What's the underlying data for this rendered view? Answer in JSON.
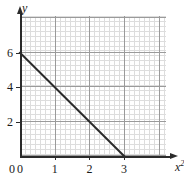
{
  "chart_data": {
    "type": "line",
    "title": "",
    "xlabel": "x²",
    "ylabel": "y",
    "xlabel_base": "x",
    "xlabel_exp": "2",
    "xlim": [
      0,
      4.2
    ],
    "ylim": [
      0,
      8.1
    ],
    "grid": true,
    "grid_minor": true,
    "grid_minor_step_x": 0.143,
    "grid_minor_step_y": 0.286,
    "grid_major_step_x": 1,
    "grid_major_step_y": 2,
    "legend": "none",
    "x_ticks": [
      0,
      1,
      2,
      3
    ],
    "x_tick_labels": [
      "0",
      "1",
      "2",
      "3"
    ],
    "y_ticks": [
      0,
      2,
      4,
      6
    ],
    "y_tick_labels": [
      "0",
      "2",
      "4",
      "6"
    ],
    "series": [
      {
        "name": "y = 6 - 2x²",
        "x": [
          0,
          3
        ],
        "values": [
          6,
          0
        ],
        "color": "#2b2b2b",
        "width": 2,
        "style": "solid"
      }
    ],
    "annotations": [],
    "colors": {
      "axis": "#2b2b2b",
      "grid_minor": "#dcdcdc",
      "grid_major": "#9a9a9a",
      "text": "#1a1a1a",
      "background": "#ffffff"
    }
  },
  "geometry": {
    "origin_x": 20,
    "origin_y": 156,
    "px_per_x": 34.7,
    "px_per_y": 17.2,
    "plot_right": 166,
    "plot_top": 16
  }
}
